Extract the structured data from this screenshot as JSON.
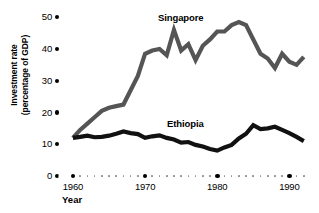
{
  "chart_data": {
    "type": "line",
    "title": "",
    "xlabel": "Year",
    "ylabel": "Investment rate (percentage of GDP)",
    "ylabel_line1": "Investment rate",
    "ylabel_line2": "(percentage of GDP)",
    "xlim": [
      1958,
      1993
    ],
    "ylim": [
      0,
      50
    ],
    "yticks": [
      0,
      10,
      20,
      30,
      40,
      50
    ],
    "ytick_labels": [
      "0",
      "10",
      "20",
      "30",
      "40",
      "50"
    ],
    "xticks_major": [
      1960,
      1970,
      1980,
      1990
    ],
    "xtick_labels": [
      "1960",
      "1970",
      "1980",
      "1990"
    ],
    "xticks_minor": [
      1958,
      1961,
      1962,
      1963,
      1964,
      1965,
      1966,
      1967,
      1968,
      1969,
      1971,
      1972,
      1973,
      1974,
      1975,
      1976,
      1977,
      1978,
      1979,
      1981,
      1982,
      1983,
      1984,
      1985,
      1986,
      1987,
      1988,
      1989,
      1991,
      1992
    ],
    "grid": false,
    "legend_position": "inline-annotation",
    "x": [
      1960,
      1961,
      1962,
      1963,
      1964,
      1965,
      1966,
      1967,
      1968,
      1969,
      1970,
      1971,
      1972,
      1973,
      1974,
      1975,
      1976,
      1977,
      1978,
      1979,
      1980,
      1981,
      1982,
      1983,
      1984,
      1985,
      1986,
      1987,
      1988,
      1989,
      1990,
      1991,
      1992
    ],
    "series": [
      {
        "name": "Singapore",
        "color": "#555555",
        "values": [
          12.0,
          14.5,
          16.5,
          18.5,
          20.5,
          21.5,
          22.0,
          22.5,
          27.0,
          31.5,
          38.5,
          39.5,
          40.0,
          38.0,
          46.0,
          39.5,
          41.5,
          36.5,
          41.0,
          43.0,
          45.5,
          45.5,
          47.5,
          48.5,
          47.5,
          43.0,
          38.5,
          37.0,
          34.0,
          38.5,
          36.0,
          35.0,
          37.5
        ]
      },
      {
        "name": "Ethiopia",
        "color": "#111111",
        "values": [
          12.0,
          12.3,
          12.7,
          12.2,
          12.3,
          12.7,
          13.3,
          14.0,
          13.5,
          13.2,
          12.0,
          12.5,
          12.8,
          12.0,
          11.5,
          10.5,
          10.7,
          9.8,
          9.3,
          8.5,
          8.0,
          9.0,
          9.8,
          11.8,
          13.3,
          16.0,
          14.8,
          15.0,
          15.5,
          14.5,
          13.5,
          12.3,
          11.0
        ]
      }
    ],
    "annotations": [
      {
        "text": "Singapore",
        "x": 1974,
        "y": 50
      },
      {
        "text": "Ethiopia",
        "x": 1978,
        "y": 17
      }
    ]
  }
}
